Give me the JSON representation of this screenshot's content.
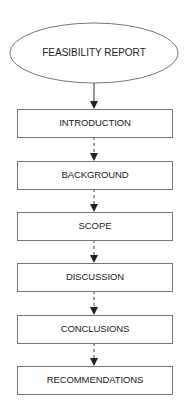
{
  "diagram": {
    "type": "flowchart",
    "start": {
      "label": "FEASIBILITY REPORT",
      "shape": "ellipse"
    },
    "steps": [
      {
        "label": "INTRODUCTION"
      },
      {
        "label": "BACKGROUND"
      },
      {
        "label": "SCOPE"
      },
      {
        "label": "DISCUSSION"
      },
      {
        "label": "CONCLUSIONS"
      },
      {
        "label": "RECOMMENDATIONS"
      }
    ],
    "connectors": [
      {
        "from": "FEASIBILITY REPORT",
        "to": "INTRODUCTION",
        "style": "solid"
      },
      {
        "from": "INTRODUCTION",
        "to": "BACKGROUND",
        "style": "dashed"
      },
      {
        "from": "BACKGROUND",
        "to": "SCOPE",
        "style": "dashed"
      },
      {
        "from": "SCOPE",
        "to": "DISCUSSION",
        "style": "dashed"
      },
      {
        "from": "DISCUSSION",
        "to": "CONCLUSIONS",
        "style": "dashed"
      },
      {
        "from": "CONCLUSIONS",
        "to": "RECOMMENDATIONS",
        "style": "dashed"
      }
    ],
    "colors": {
      "stroke": "#777777",
      "text": "#222222",
      "background": "#ffffff"
    }
  }
}
